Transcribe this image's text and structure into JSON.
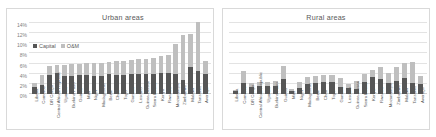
{
  "chart_data": [
    {
      "type": "bar",
      "title": "Urban areas",
      "xlabel": "",
      "ylabel": "",
      "ylim": [
        0,
        14
      ],
      "ytick_labels": [
        "0%",
        "2%",
        "4%",
        "6%",
        "8%",
        "10%",
        "12%",
        "14%"
      ],
      "ytick_values": [
        0,
        2,
        4,
        6,
        8,
        10,
        12,
        14
      ],
      "grid": true,
      "stacked": true,
      "legend": [
        "Capital",
        "O&M"
      ],
      "legend_position": "upper-left-inside",
      "categories": [
        "Liberia",
        "Comoros",
        "DR Congo",
        "Central African Republic",
        "Uganda",
        "Burkina Faso",
        "Guinea",
        "Mali",
        "Niger",
        "Madagascar",
        "Benin",
        "Chad",
        "Togo",
        "Gambia",
        "Lesotho",
        "Guinea-Bissau",
        "Sierra Leone",
        "Kenya",
        "Rwanda",
        "Mozambique",
        "Zimbabwe",
        "Malawi",
        "Tanzania",
        "Average"
      ],
      "series": [
        {
          "name": "Capital",
          "values": [
            1.3,
            1.8,
            3.7,
            4.2,
            3.5,
            3.6,
            3.7,
            3.7,
            3.6,
            3.6,
            3.9,
            3.8,
            3.8,
            4.0,
            4.0,
            4.0,
            4.0,
            4.2,
            4.2,
            4.0,
            2.8,
            5.3,
            4.6,
            3.9
          ]
        },
        {
          "name": "O&M",
          "values": [
            0.9,
            1.9,
            1.8,
            1.6,
            2.2,
            2.3,
            2.3,
            2.4,
            2.6,
            2.6,
            2.5,
            2.7,
            2.8,
            2.8,
            3.0,
            3.0,
            3.2,
            3.3,
            3.4,
            5.9,
            8.9,
            6.5,
            9.6,
            2.7
          ]
        }
      ]
    },
    {
      "type": "bar",
      "title": "Rural areas",
      "xlabel": "",
      "ylabel": "",
      "ylim": [
        0,
        14
      ],
      "ytick_labels": [],
      "ytick_values": [
        0,
        2,
        4,
        6,
        8,
        10,
        12,
        14
      ],
      "grid": true,
      "stacked": true,
      "legend": [
        "Capital",
        "O&M"
      ],
      "legend_position": "none",
      "categories": [
        "Liberia",
        "Comoros",
        "DR Congo",
        "Central African Republic",
        "Uganda",
        "Burkina Faso",
        "Guinea",
        "Mali",
        "Niger",
        "Madagascar",
        "Benin",
        "Chad",
        "Togo",
        "Gambia",
        "Lesotho",
        "Guinea-Bissau",
        "Sierra Leone",
        "Kenya",
        "Rwanda",
        "Mozambique",
        "Zimbabwe",
        "Malawi",
        "Tanzania",
        "Average"
      ],
      "series": [
        {
          "name": "Capital",
          "values": [
            0.5,
            2.2,
            1.4,
            1.6,
            1.5,
            1.5,
            3.0,
            0.6,
            1.1,
            2.0,
            2.2,
            2.3,
            2.3,
            1.3,
            1.2,
            0.9,
            2.3,
            3.3,
            2.9,
            2.2,
            2.6,
            3.1,
            2.1,
            2.0
          ]
        },
        {
          "name": "O&M",
          "values": [
            0.3,
            2.3,
            0.8,
            0.8,
            0.9,
            1.1,
            2.6,
            0.4,
            1.2,
            1.4,
            1.3,
            1.4,
            1.4,
            1.9,
            0.8,
            1.6,
            1.7,
            1.4,
            2.4,
            2.0,
            2.8,
            3.0,
            4.3,
            1.5
          ]
        }
      ]
    }
  ]
}
